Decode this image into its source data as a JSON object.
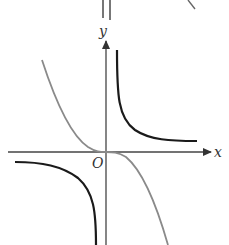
{
  "diagram": {
    "type": "function-graphs",
    "axes": {
      "x_label": "x",
      "y_label": "y",
      "origin_label": "O"
    },
    "curves": [
      {
        "name": "hyperbola",
        "description": "y = k/x, branches in quadrants I and III",
        "color": "#1a1a1a"
      },
      {
        "name": "cubic",
        "description": "decreasing cubic through origin (y = -x^3)",
        "color": "#8a8a8a"
      }
    ],
    "colors": {
      "axis": "#444444",
      "hyperbola": "#1a1a1a",
      "cubic": "#8a8a8a"
    }
  }
}
